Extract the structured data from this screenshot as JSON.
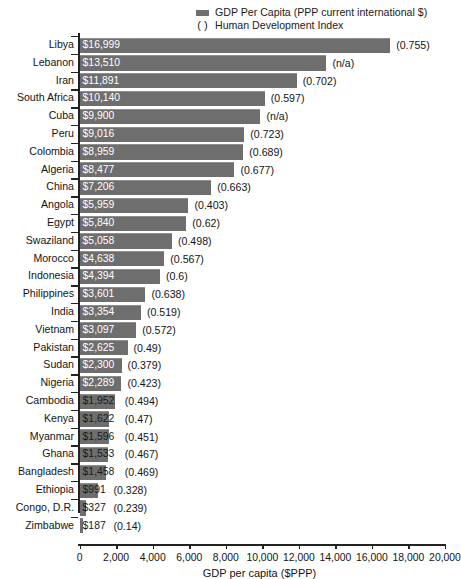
{
  "legend": {
    "series_label": "GDP Per Capita (PPP current international $)",
    "paren_symbol": "( )",
    "paren_label": "Human Development Index",
    "swatch_color": "#6e6e6e"
  },
  "axis": {
    "xlabel": "GDP per capita ($PPP)",
    "xticks": [
      0,
      2000,
      4000,
      6000,
      8000,
      10000,
      12000,
      14000,
      16000,
      18000,
      20000
    ],
    "xtick_labels": [
      "0",
      "2,000",
      "4,000",
      "6,000",
      "8,000",
      "10,000",
      "12,000",
      "14,000",
      "16,000",
      "18,000",
      "20,000"
    ],
    "xmin": 0,
    "xmax": 20000
  },
  "chart_data": {
    "type": "bar",
    "orientation": "horizontal",
    "title": "",
    "xlabel": "GDP per capita ($PPP)",
    "ylabel": "",
    "xlim": [
      0,
      20000
    ],
    "grid": false,
    "legend_position": "top-right",
    "categories": [
      "Libya",
      "Lebanon",
      "Iran",
      "South Africa",
      "Cuba",
      "Peru",
      "Colombia",
      "Algeria",
      "China",
      "Angola",
      "Egypt",
      "Swaziland",
      "Morocco",
      "Indonesia",
      "Philippines",
      "India",
      "Vietnam",
      "Pakistan",
      "Sudan",
      "Nigeria",
      "Cambodia",
      "Kenya",
      "Myanmar",
      "Ghana",
      "Bangladesh",
      "Ethiopia",
      "Congo, D.R.",
      "Zimbabwe"
    ],
    "values": [
      16999,
      13510,
      11891,
      10140,
      9900,
      9016,
      8959,
      8477,
      7206,
      5959,
      5840,
      5058,
      4638,
      4394,
      3601,
      3354,
      3097,
      2625,
      2300,
      2289,
      1952,
      1622,
      1596,
      1533,
      1458,
      991,
      327,
      187
    ],
    "value_labels": [
      "$16,999",
      "$13,510",
      "$11,891",
      "$10,140",
      "$9,900",
      "$9,016",
      "$8,959",
      "$8,477",
      "$7,206",
      "$5,959",
      "$5,840",
      "$5,058",
      "$4,638",
      "$4,394",
      "$3,601",
      "$3,354",
      "$3,097",
      "$2,625",
      "$2,300",
      "$2,289",
      "$1,952",
      "$1,622",
      "$1,596",
      "$1,533",
      "$1,458",
      "$991",
      "$327",
      "$187"
    ],
    "hdi_labels": [
      "(0.755)",
      "(n/a)",
      "(0.702)",
      "(0.597)",
      "(n/a)",
      "(0.723)",
      "(0.689)",
      "(0.677)",
      "(0.663)",
      "(0.403)",
      "(0.62)",
      "(0.498)",
      "(0.567)",
      "(0.6)",
      "(0.638)",
      "(0.519)",
      "(0.572)",
      "(0.49)",
      "(0.379)",
      "(0.423)",
      "(0.494)",
      "(0.47)",
      "(0.451)",
      "(0.467)",
      "(0.469)",
      "(0.328)",
      "(0.239)",
      "(0.14)"
    ],
    "hdi_values": [
      0.755,
      null,
      0.702,
      0.597,
      null,
      0.723,
      0.689,
      0.677,
      0.663,
      0.403,
      0.62,
      0.498,
      0.567,
      0.6,
      0.638,
      0.519,
      0.572,
      0.49,
      0.379,
      0.423,
      0.494,
      0.47,
      0.451,
      0.467,
      0.469,
      0.328,
      0.239,
      0.14
    ],
    "series": [
      {
        "name": "GDP Per Capita (PPP current international $)",
        "color": "#6e6e6e"
      }
    ]
  }
}
